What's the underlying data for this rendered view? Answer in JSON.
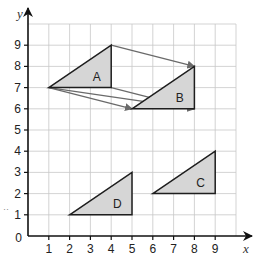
{
  "diagram": {
    "type": "coordinate-grid-translation",
    "axes": {
      "x_label": "x",
      "y_label": "y",
      "origin_label": "0",
      "x_ticks": [
        "1",
        "2",
        "3",
        "4",
        "5",
        "6",
        "7",
        "8",
        "9"
      ],
      "y_ticks": [
        "1",
        "2",
        "3",
        "4",
        "5",
        "6",
        "7",
        "8",
        "9"
      ],
      "x_range": [
        0,
        10
      ],
      "y_range": [
        0,
        10
      ],
      "grid": true
    },
    "shapes": [
      {
        "label": "A",
        "vertices": [
          [
            1,
            7
          ],
          [
            4,
            9
          ],
          [
            4,
            7
          ]
        ],
        "label_pos": [
          3.3,
          7.5
        ]
      },
      {
        "label": "B",
        "vertices": [
          [
            5,
            6
          ],
          [
            8,
            8
          ],
          [
            8,
            6
          ]
        ],
        "label_pos": [
          7.3,
          6.5
        ]
      },
      {
        "label": "C",
        "vertices": [
          [
            6,
            2
          ],
          [
            9,
            4
          ],
          [
            9,
            2
          ]
        ],
        "label_pos": [
          8.3,
          2.5
        ]
      },
      {
        "label": "D",
        "vertices": [
          [
            2,
            1
          ],
          [
            5,
            3
          ],
          [
            5,
            1
          ]
        ],
        "label_pos": [
          4.3,
          1.5
        ]
      }
    ],
    "vectors": [
      {
        "from": [
          4,
          9
        ],
        "to": [
          8,
          8
        ]
      },
      {
        "from": [
          1,
          7
        ],
        "to": [
          5,
          6
        ]
      },
      {
        "from": [
          4,
          7
        ],
        "to": [
          8,
          6
        ]
      },
      {
        "from": [
          1,
          7
        ],
        "to": [
          8,
          6
        ]
      }
    ],
    "stray_mark": "··",
    "colors": {
      "fill": "#d6d6d6",
      "outline": "#1e1e1e",
      "vector": "#6a6a6a",
      "grid": "#c8c8c8"
    }
  }
}
